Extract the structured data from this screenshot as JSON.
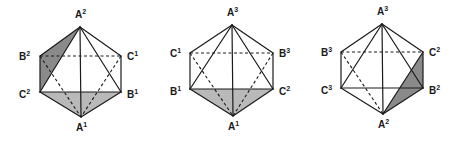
{
  "colors": {
    "dark_shade": "#8a8a8a",
    "light_shade": "#b9b9b9",
    "line": "#1a1a1a"
  },
  "figures": [
    {
      "name": "octahedron-1",
      "vertices": {
        "A2": {
          "x": 80,
          "y": 27,
          "label": "A",
          "sup": "2",
          "lx": 75,
          "ly": 18
        },
        "B2": {
          "x": 40,
          "y": 56,
          "label": "B",
          "sup": "2",
          "lx": 19,
          "ly": 60
        },
        "C1": {
          "x": 121,
          "y": 56,
          "label": "C",
          "sup": "1",
          "lx": 127,
          "ly": 60
        },
        "C2": {
          "x": 40,
          "y": 92,
          "label": "C",
          "sup": "2",
          "lx": 19,
          "ly": 98
        },
        "B1": {
          "x": 121,
          "y": 92,
          "label": "B",
          "sup": "1",
          "lx": 127,
          "ly": 98
        },
        "A1": {
          "x": 81,
          "y": 117,
          "label": "A",
          "sup": "1",
          "lx": 76,
          "ly": 131
        }
      },
      "shaded": [
        {
          "points": [
            "A2",
            "B2",
            "C2"
          ],
          "tone": "dark_shade"
        },
        {
          "points": [
            "C2",
            "B1",
            "A1"
          ],
          "tone": "light_shade"
        }
      ],
      "hidden_edges": [
        [
          "B2",
          "C1"
        ],
        [
          "B2",
          "A1"
        ],
        [
          "C1",
          "A1"
        ]
      ],
      "edges": [
        [
          "A2",
          "B2"
        ],
        [
          "A2",
          "C2"
        ],
        [
          "A2",
          "A1"
        ],
        [
          "A2",
          "B1"
        ],
        [
          "A2",
          "C1"
        ],
        [
          "B2",
          "C2"
        ],
        [
          "C1",
          "B1"
        ],
        [
          "C2",
          "B1"
        ],
        [
          "C2",
          "A1"
        ],
        [
          "B1",
          "A1"
        ]
      ]
    },
    {
      "name": "octahedron-2",
      "vertices": {
        "A3": {
          "x": 232,
          "y": 25,
          "label": "A",
          "sup": "3",
          "lx": 227,
          "ly": 16
        },
        "C1": {
          "x": 190,
          "y": 53,
          "label": "C",
          "sup": "1",
          "lx": 170,
          "ly": 57
        },
        "B3": {
          "x": 273,
          "y": 53,
          "label": "B",
          "sup": "3",
          "lx": 279,
          "ly": 57
        },
        "B1": {
          "x": 190,
          "y": 89,
          "label": "B",
          "sup": "1",
          "lx": 170,
          "ly": 95
        },
        "C2": {
          "x": 273,
          "y": 89,
          "label": "C",
          "sup": "2",
          "lx": 279,
          "ly": 95
        },
        "A1": {
          "x": 233,
          "y": 116,
          "label": "A",
          "sup": "1",
          "lx": 228,
          "ly": 130
        }
      },
      "shaded": [
        {
          "points": [
            "B1",
            "C2",
            "A1"
          ],
          "tone": "light_shade"
        }
      ],
      "hidden_edges": [
        [
          "C1",
          "B3"
        ],
        [
          "C1",
          "A1"
        ],
        [
          "B3",
          "A1"
        ]
      ],
      "edges": [
        [
          "A3",
          "C1"
        ],
        [
          "A3",
          "B1"
        ],
        [
          "A3",
          "A1"
        ],
        [
          "A3",
          "C2"
        ],
        [
          "A3",
          "B3"
        ],
        [
          "C1",
          "B1"
        ],
        [
          "B3",
          "C2"
        ],
        [
          "B1",
          "C2"
        ],
        [
          "B1",
          "A1"
        ],
        [
          "C2",
          "A1"
        ]
      ]
    },
    {
      "name": "octahedron-3",
      "vertices": {
        "A3": {
          "x": 382,
          "y": 24,
          "label": "A",
          "sup": "3",
          "lx": 377,
          "ly": 15
        },
        "B3": {
          "x": 341,
          "y": 52,
          "label": "B",
          "sup": "3",
          "lx": 321,
          "ly": 56
        },
        "C2": {
          "x": 423,
          "y": 52,
          "label": "C",
          "sup": "2",
          "lx": 429,
          "ly": 56
        },
        "C3": {
          "x": 341,
          "y": 88,
          "label": "C",
          "sup": "3",
          "lx": 321,
          "ly": 94
        },
        "B2": {
          "x": 423,
          "y": 88,
          "label": "B",
          "sup": "2",
          "lx": 429,
          "ly": 94
        },
        "A2": {
          "x": 383,
          "y": 114,
          "label": "A",
          "sup": "2",
          "lx": 378,
          "ly": 128
        }
      },
      "shaded": [
        {
          "points": [
            "A2",
            "C2",
            "B2"
          ],
          "tone": "dark_shade"
        }
      ],
      "hidden_edges": [
        [
          "B3",
          "C2"
        ],
        [
          "B3",
          "A2"
        ]
      ],
      "edges": [
        [
          "A3",
          "B3"
        ],
        [
          "A3",
          "C3"
        ],
        [
          "A3",
          "A2"
        ],
        [
          "A3",
          "B2"
        ],
        [
          "A3",
          "C2"
        ],
        [
          "B3",
          "C3"
        ],
        [
          "C2",
          "B2"
        ],
        [
          "C3",
          "B2"
        ],
        [
          "C3",
          "A2"
        ],
        [
          "A2",
          "B2"
        ],
        [
          "A2",
          "C2"
        ]
      ]
    }
  ]
}
